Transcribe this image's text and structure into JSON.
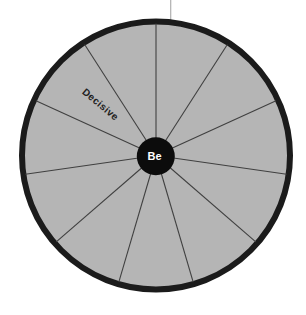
{
  "wheel": {
    "center_label": "Be",
    "segment_count": 11,
    "segments": [
      {
        "label": ""
      },
      {
        "label": "Decisive"
      },
      {
        "label": ""
      },
      {
        "label": ""
      },
      {
        "label": ""
      },
      {
        "label": ""
      },
      {
        "label": ""
      },
      {
        "label": ""
      },
      {
        "label": ""
      },
      {
        "label": ""
      },
      {
        "label": ""
      }
    ],
    "colors": {
      "wheel_fill": "#b5b5b5",
      "rim": "#1b1b1b",
      "spoke": "#404040",
      "hub": "#0c0c0c",
      "center_label_text": "#ffffff",
      "segment_label_text": "#212121",
      "pointer_line": "#b0b0b0",
      "background": "#ffffff"
    }
  }
}
